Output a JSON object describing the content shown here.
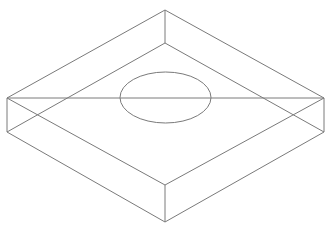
{
  "diagram": {
    "title": "",
    "type": "isometric-wireframe",
    "stroke_color": "#7a7a7a",
    "background": "#ffffff",
    "stroke_width": 1,
    "vertices": {
      "top_back": [
        165,
        10
      ],
      "top_left": [
        7,
        98
      ],
      "top_right": [
        324,
        98
      ],
      "top_front": [
        165,
        185
      ],
      "bottom_back": [
        165,
        43
      ],
      "bottom_left": [
        7,
        132
      ],
      "bottom_right": [
        324,
        132
      ],
      "bottom_front": [
        165,
        222
      ]
    },
    "edges": [
      {
        "name": "top-back-left",
        "from": "top_left",
        "to": "top_back"
      },
      {
        "name": "top-back-right",
        "from": "top_back",
        "to": "top_right"
      },
      {
        "name": "top-front-left",
        "from": "top_left",
        "to": "top_front"
      },
      {
        "name": "top-front-right",
        "from": "top_front",
        "to": "top_right"
      },
      {
        "name": "bottom-back-left",
        "from": "bottom_left",
        "to": "bottom_back"
      },
      {
        "name": "bottom-back-right",
        "from": "bottom_back",
        "to": "bottom_right"
      },
      {
        "name": "bottom-front-left",
        "from": "bottom_left",
        "to": "bottom_front"
      },
      {
        "name": "bottom-front-right",
        "from": "bottom_front",
        "to": "bottom_right"
      },
      {
        "name": "vertical-back",
        "from": "top_back",
        "to": "bottom_back"
      },
      {
        "name": "vertical-left",
        "from": "top_left",
        "to": "bottom_left"
      },
      {
        "name": "vertical-right",
        "from": "top_right",
        "to": "bottom_right"
      },
      {
        "name": "vertical-front",
        "from": "top_front",
        "to": "bottom_front"
      },
      {
        "name": "diagonal-left-right",
        "from": "top_left",
        "to": "top_right"
      }
    ],
    "ellipse": {
      "cx": 165.5,
      "cy": 97.5,
      "rx": 45.5,
      "ry": 25.5
    }
  }
}
